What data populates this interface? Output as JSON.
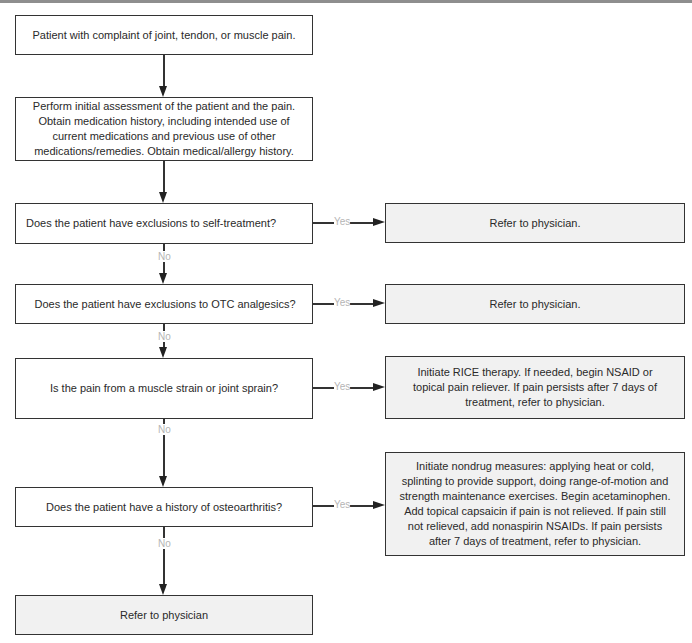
{
  "flowchart": {
    "start": "Patient with complaint of joint, tendon, or muscle pain.",
    "assessment": "Perform initial assessment of the patient and the pain. Obtain medication history, including intended use of current medications and previous use of other medications/remedies. Obtain medical/allergy history.",
    "questions": [
      "Does the patient have exclusions to self-treatment?",
      "Does the patient have exclusions to OTC analgesics?",
      "Is the pain from a muscle strain or joint sprain?",
      "Does the patient have a history of osteoarthritis?"
    ],
    "outcomes": [
      "Refer to physician.",
      "Refer to physician.",
      "Initiate RICE therapy. If needed, begin NSAID or topical pain reliever. If pain persists after 7 days of treatment, refer to physician.",
      "Initiate nondrug measures: applying heat or cold, splinting to provide support, doing range-of-motion and strength maintenance exercises. Begin acetaminophen. Add topical capsaicin if pain is not relieved. If pain still not relieved, add nonaspirin NSAIDs. If pain persists after 7 days of treatment, refer to physician."
    ],
    "final": "Refer to physician",
    "yes_label": "Yes",
    "no_label": "No"
  }
}
